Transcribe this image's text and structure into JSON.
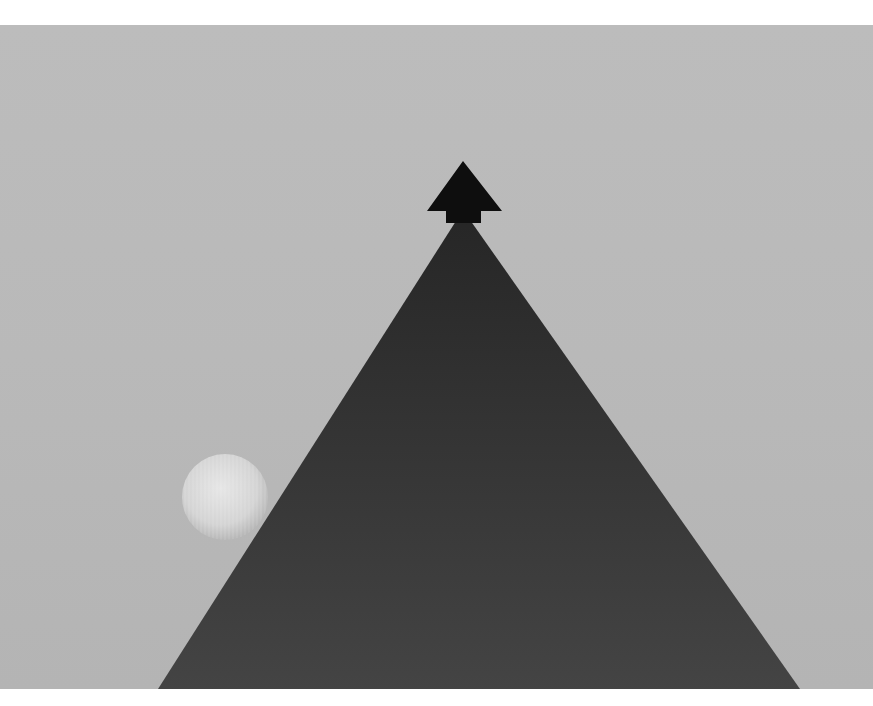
{
  "image": {
    "description": "Monochrome photograph: dark pyramid/cone topped by a black arrow, with a pale sphere to the left, against a flat grey background",
    "colors": {
      "background": "#bababa",
      "pyramid": "#3a3a3a",
      "arrow": "#0e0e0e",
      "sphere": "#d9d9d9"
    }
  },
  "caption": {
    "text": ""
  }
}
